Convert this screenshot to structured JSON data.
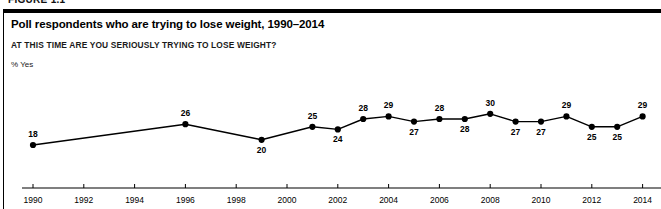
{
  "figure": {
    "kicker": "FIGURE 1.1"
  },
  "chart_data": {
    "type": "line",
    "title": "Poll respondents who are trying to lose weight, 1990–2014",
    "subtitle": "AT THIS TIME ARE YOU SERIOUSLY TRYING TO LOSE WEIGHT?",
    "ylabel": "% Yes",
    "xlabel": "",
    "grid": false,
    "legend": "none",
    "ylim": [
      15,
      32
    ],
    "xlim": [
      1989.5,
      2014.8
    ],
    "x_tick_labels": [
      "1990",
      "1992",
      "1994",
      "1996",
      "1998",
      "2000",
      "2002",
      "2004",
      "2006",
      "2008",
      "2010",
      "2012",
      "2014"
    ],
    "x_ticks": [
      1990,
      1992,
      1994,
      1996,
      1998,
      2000,
      2002,
      2004,
      2006,
      2008,
      2010,
      2012,
      2014
    ],
    "series": [
      {
        "name": "% Yes",
        "color": "#000000",
        "x": [
          1990,
          1996,
          1999,
          2001,
          2002,
          2003,
          2004,
          2005,
          2006,
          2007,
          2008,
          2009,
          2010,
          2011,
          2012,
          2013,
          2014
        ],
        "values": [
          18,
          26,
          20,
          25,
          24,
          28,
          29,
          27,
          28,
          28,
          30,
          27,
          27,
          29,
          25,
          25,
          29
        ],
        "label_positions": [
          "above",
          "above",
          "below",
          "above",
          "below",
          "above",
          "above",
          "below",
          "above",
          "below",
          "above",
          "below",
          "below",
          "above",
          "below",
          "below",
          "above"
        ]
      }
    ]
  }
}
